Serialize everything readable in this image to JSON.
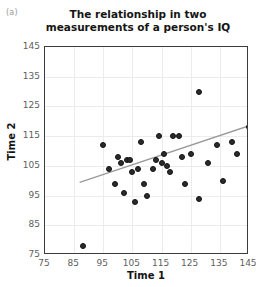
{
  "panel": {
    "label": "(a)"
  },
  "chart_data": {
    "type": "scatter",
    "title": "The relationship in two measurements of a person's IQ",
    "title_line1": "The relationship in two",
    "title_line2": "measurements of a person's IQ",
    "xlabel": "Time 1",
    "ylabel": "Time 2",
    "xlim": [
      75,
      145
    ],
    "ylim": [
      75,
      145
    ],
    "xticks": [
      75,
      85,
      95,
      105,
      115,
      125,
      135,
      145
    ],
    "yticks": [
      75,
      85,
      95,
      105,
      115,
      125,
      135,
      145
    ],
    "grid": true,
    "legend": null,
    "marker_color": "#2b2b2b",
    "trendline_color": "#9a9a9a",
    "points": [
      {
        "x": 88,
        "y": 78
      },
      {
        "x": 95,
        "y": 112
      },
      {
        "x": 97,
        "y": 104
      },
      {
        "x": 99,
        "y": 99
      },
      {
        "x": 100,
        "y": 108
      },
      {
        "x": 101,
        "y": 106
      },
      {
        "x": 102,
        "y": 96
      },
      {
        "x": 103,
        "y": 107
      },
      {
        "x": 104,
        "y": 107
      },
      {
        "x": 105,
        "y": 103
      },
      {
        "x": 106,
        "y": 93
      },
      {
        "x": 107,
        "y": 104
      },
      {
        "x": 108,
        "y": 113
      },
      {
        "x": 109,
        "y": 99
      },
      {
        "x": 110,
        "y": 95
      },
      {
        "x": 112,
        "y": 104
      },
      {
        "x": 113,
        "y": 107
      },
      {
        "x": 114,
        "y": 115
      },
      {
        "x": 115,
        "y": 106
      },
      {
        "x": 116,
        "y": 109
      },
      {
        "x": 117,
        "y": 105
      },
      {
        "x": 118,
        "y": 103
      },
      {
        "x": 119,
        "y": 115
      },
      {
        "x": 121,
        "y": 115
      },
      {
        "x": 122,
        "y": 108
      },
      {
        "x": 123,
        "y": 99
      },
      {
        "x": 125,
        "y": 109
      },
      {
        "x": 128,
        "y": 130
      },
      {
        "x": 128,
        "y": 94
      },
      {
        "x": 131,
        "y": 106
      },
      {
        "x": 134,
        "y": 112
      },
      {
        "x": 136,
        "y": 100
      },
      {
        "x": 139,
        "y": 113
      },
      {
        "x": 141,
        "y": 109
      },
      {
        "x": 145,
        "y": 118
      }
    ],
    "trendline": {
      "x1": 87,
      "y1": 99,
      "x2": 145,
      "y2": 118
    }
  }
}
